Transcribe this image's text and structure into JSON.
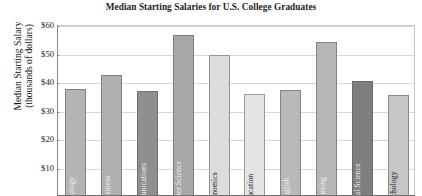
{
  "chart_data": {
    "type": "bar",
    "title": "Median Starting Salaries for U.S. College Graduates",
    "xlabel": "",
    "ylabel": "Median Starting Salary (thousands of dollars)",
    "ylabel_lines": [
      "Median Starting Salary",
      "(thousands of dollars)"
    ],
    "ylim": [
      0,
      60
    ],
    "ytick_labels": [
      "$60",
      "$50",
      "$40",
      "$30",
      "$20",
      "$10"
    ],
    "ytick_values": [
      60,
      50,
      40,
      30,
      20,
      10
    ],
    "grid": true,
    "legend": "none",
    "units": "thousands of dollars",
    "categories": [
      "Biology",
      "Business",
      "Communications",
      "Computer Science",
      "Economics",
      "Education",
      "English",
      "Nursing",
      "Political Science",
      "Psychology"
    ],
    "values": [
      37.5,
      42.5,
      37.0,
      56.5,
      49.5,
      35.8,
      37.3,
      54.0,
      40.5,
      35.5
    ],
    "bars": [
      {
        "category": "Biology",
        "value": 37.5,
        "color": "#b4b4b4",
        "label_color": "light"
      },
      {
        "category": "Business",
        "value": 42.5,
        "color": "#b0b0b0",
        "label_color": "light"
      },
      {
        "category": "Communications",
        "value": 37.0,
        "color": "#8f8f8f",
        "label_color": "light"
      },
      {
        "category": "Computer Science",
        "value": 56.5,
        "color": "#a8a8a8",
        "label_color": "light"
      },
      {
        "category": "Economics",
        "value": 49.5,
        "color": "#dcdcdc",
        "label_color": "dark"
      },
      {
        "category": "Education",
        "value": 35.8,
        "color": "#e4e4e4",
        "label_color": "dark"
      },
      {
        "category": "English",
        "value": 37.3,
        "color": "#b9b9b9",
        "label_color": "light"
      },
      {
        "category": "Nursing",
        "value": 54.0,
        "color": "#b6b6b6",
        "label_color": "light"
      },
      {
        "category": "Political Science",
        "value": 40.5,
        "color": "#7e7e7e",
        "label_color": "light"
      },
      {
        "category": "Psychology",
        "value": 35.5,
        "color": "#c6c6c6",
        "label_color": "dark"
      }
    ]
  }
}
